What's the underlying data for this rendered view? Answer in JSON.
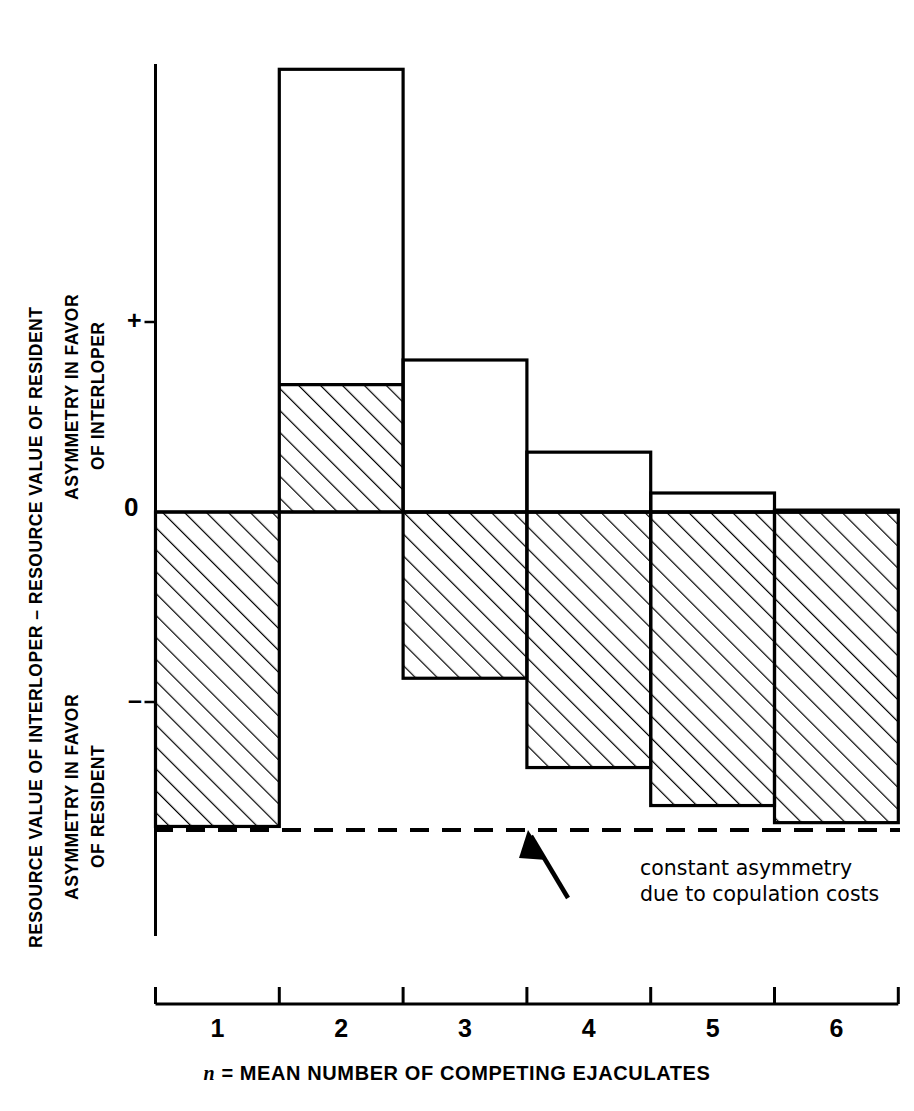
{
  "chart_data": {
    "type": "bar",
    "title": "",
    "ylabel_main": "RESOURCE VALUE OF INTERLOPER – RESOURCE VALUE OF RESIDENT",
    "ylabel_positive_line1": "ASYMMETRY IN FAVOR",
    "ylabel_positive_line2": "OF INTERLOPER",
    "ylabel_negative_line1": "ASYMMETRY IN FAVOR",
    "ylabel_negative_line2": "OF RESIDENT",
    "xlabel": "n = MEAN NUMBER OF COMPETING EJACULATES",
    "xlabel_italic_prefix": "n",
    "xlabel_rest": " = MEAN NUMBER OF COMPETING EJACULATES",
    "categories": [
      "1",
      "2",
      "3",
      "4",
      "5",
      "6"
    ],
    "ytick_labels": [
      "+",
      "0",
      "–"
    ],
    "ytick_values": [
      1,
      0,
      -1
    ],
    "ylim": [
      -1.67,
      2.33
    ],
    "grid": false,
    "legend": false,
    "series": [
      {
        "name": "positive top (resource value difference, upper envelope)",
        "values": [
          0.0,
          2.33,
          0.8,
          0.315,
          0.1,
          0.01
        ]
      },
      {
        "name": "negative bottom (lower envelope)",
        "values": [
          -1.655,
          0.0,
          -0.875,
          -1.345,
          -1.545,
          -1.635
        ]
      },
      {
        "name": "hatched (shaded) region upper boundary",
        "values": [
          0.0,
          0.67,
          0.0,
          0.0,
          0.0,
          0.0
        ]
      }
    ],
    "constant_line": {
      "value": -1.675,
      "style": "dashed",
      "label_line1": "constant asymmetry",
      "label_line2": "due to copulation costs"
    },
    "annotation": {
      "line1": "constant asymmetry",
      "line2": "due to copulation costs",
      "arrow": "arrow-up-left"
    },
    "colors": {
      "line": "#000000",
      "background": "#ffffff",
      "hatch": "#000000"
    }
  },
  "axes": {
    "y_title": "RESOURCE VALUE OF INTERLOPER – RESOURCE VALUE OF RESIDENT",
    "x_title_italic": "n",
    "x_title_rest": " = MEAN NUMBER OF COMPETING EJACULATES"
  }
}
